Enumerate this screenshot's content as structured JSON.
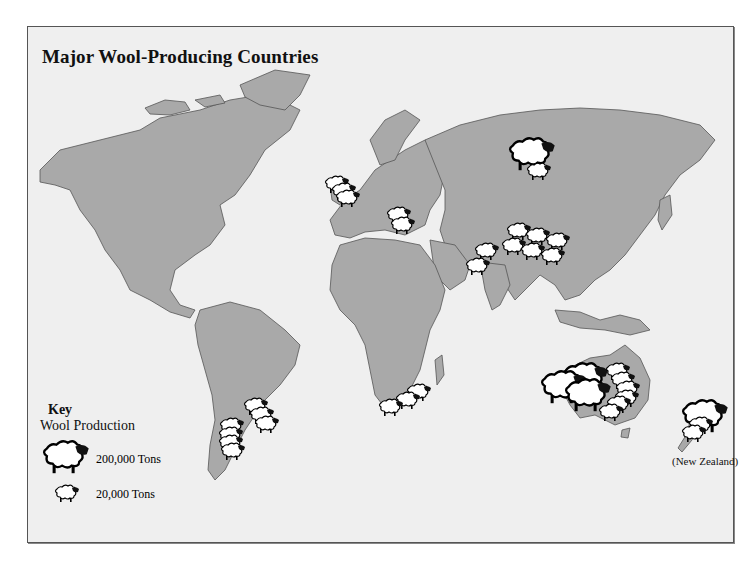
{
  "map": {
    "title": "Major Wool-Producing Countries",
    "colors": {
      "background": "#efefef",
      "land": "#a9a9a9",
      "border": "#555555",
      "sheep_body": "#ffffff",
      "sheep_head": "#111111"
    },
    "key": {
      "title": "Key",
      "subtitle": "Wool Production",
      "entries": [
        {
          "icon": "large-sheep-icon",
          "label": "200,000 Tons",
          "value_tons": 200000
        },
        {
          "icon": "small-sheep-icon",
          "label": "20,000 Tons",
          "value_tons": 20000
        }
      ]
    },
    "inset_labels": {
      "new_zealand": "(New Zealand)"
    },
    "producers": [
      {
        "region": "Russia",
        "large": 1,
        "small": 1
      },
      {
        "region": "United Kingdom",
        "large": 0,
        "small": 3
      },
      {
        "region": "Romania",
        "large": 0,
        "small": 2
      },
      {
        "region": "China",
        "large": 0,
        "small": 6
      },
      {
        "region": "Pakistan / India",
        "large": 0,
        "small": 2
      },
      {
        "region": "Uruguay",
        "large": 0,
        "small": 3
      },
      {
        "region": "Argentina",
        "large": 0,
        "small": 4
      },
      {
        "region": "South Africa",
        "large": 0,
        "small": 3
      },
      {
        "region": "Australia",
        "large": 3,
        "small": 6
      },
      {
        "region": "New Zealand",
        "large": 1,
        "small": 2
      }
    ]
  }
}
